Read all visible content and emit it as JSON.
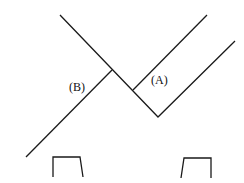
{
  "diagram": {
    "stroke_color": "#1a1a1a",
    "labels": {
      "a": "(A)",
      "b": "(B)"
    }
  }
}
